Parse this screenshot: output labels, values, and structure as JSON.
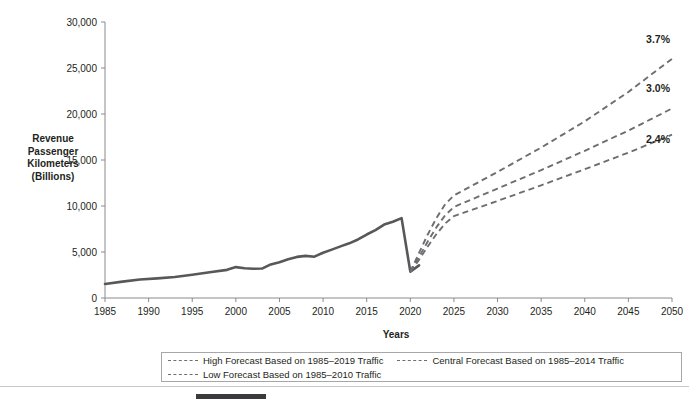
{
  "chart_data": {
    "type": "line",
    "title": "",
    "xlabel": "Years",
    "ylabel": "Revenue Passenger Kilometers (Billions)",
    "ylabel_lines": [
      "Revenue",
      "Passenger",
      "Kilometers",
      "(Billions)"
    ],
    "xlim": [
      1985,
      2050
    ],
    "ylim": [
      0,
      30000
    ],
    "grid": false,
    "legend_position": "bottom",
    "x_ticks": [
      1985,
      1990,
      1995,
      2000,
      2005,
      2010,
      2015,
      2020,
      2025,
      2030,
      2035,
      2040,
      2045,
      2050
    ],
    "x_tick_labels": [
      "1985",
      "1990",
      "1995",
      "2000",
      "2005",
      "2010",
      "2015",
      "2020",
      "2025",
      "2030",
      "2035",
      "2040",
      "2045",
      "2050"
    ],
    "y_ticks": [
      0,
      5000,
      10000,
      15000,
      20000,
      25000,
      30000
    ],
    "y_tick_labels": [
      "0",
      "5,000",
      "10,000",
      "15,000",
      "20,000",
      "25,000",
      "30,000"
    ],
    "series": [
      {
        "name": "Historical Traffic",
        "style": "solid",
        "color": "#58585b",
        "x": [
          1985,
          1987,
          1989,
          1991,
          1993,
          1995,
          1997,
          1999,
          2000,
          2001,
          2002,
          2003,
          2004,
          2005,
          2006,
          2007,
          2008,
          2009,
          2010,
          2011,
          2012,
          2013,
          2014,
          2015,
          2016,
          2017,
          2018,
          2019,
          2020,
          2021
        ],
        "y": [
          1530,
          1780,
          2010,
          2130,
          2280,
          2530,
          2800,
          3060,
          3360,
          3230,
          3180,
          3200,
          3650,
          3890,
          4200,
          4470,
          4580,
          4490,
          4920,
          5260,
          5610,
          5940,
          6360,
          6900,
          7380,
          7980,
          8280,
          8680,
          2870,
          3550
        ]
      },
      {
        "name": "High Forecast Based on 1985–2019 Traffic",
        "style": "dashed",
        "color": "#6d6e71",
        "growth_label": "3.7%",
        "x": [
          2020,
          2021,
          2022,
          2023,
          2024,
          2025,
          2030,
          2035,
          2040,
          2045,
          2050
        ],
        "y": [
          2870,
          4900,
          6900,
          8700,
          10200,
          11150,
          13700,
          16350,
          19200,
          22400,
          26000
        ]
      },
      {
        "name": "Central Forecast Based on 1985–2014 Traffic",
        "style": "dashed",
        "color": "#6d6e71",
        "growth_label": "3.0%",
        "x": [
          2020,
          2021,
          2022,
          2023,
          2024,
          2025,
          2030,
          2035,
          2040,
          2045,
          2050
        ],
        "y": [
          2870,
          4450,
          6150,
          7700,
          9000,
          9900,
          11900,
          13900,
          16000,
          18200,
          20600
        ]
      },
      {
        "name": "Low Forecast Based on 1985–2010 Traffic",
        "style": "dashed",
        "color": "#6d6e71",
        "growth_label": "2.4%",
        "x": [
          2020,
          2021,
          2022,
          2023,
          2024,
          2025,
          2030,
          2035,
          2040,
          2045,
          2050
        ],
        "y": [
          2870,
          4150,
          5600,
          6950,
          8100,
          8900,
          10550,
          12250,
          14000,
          15800,
          17750
        ]
      }
    ],
    "annotations": [
      {
        "text": "3.7%",
        "x": 2050,
        "y": 27700
      },
      {
        "text": "3.0%",
        "x": 2050,
        "y": 22400
      },
      {
        "text": "2.4%",
        "x": 2050,
        "y": 16800
      }
    ]
  },
  "legend": {
    "entries": [
      {
        "label": "High Forecast Based on 1985–2019 Traffic",
        "style": "dashed"
      },
      {
        "label": "Central Forecast Based on 1985–2014 Traffic",
        "style": "dashed"
      },
      {
        "label": "Low Forecast Based on 1985–2010 Traffic",
        "style": "dashed"
      }
    ]
  }
}
